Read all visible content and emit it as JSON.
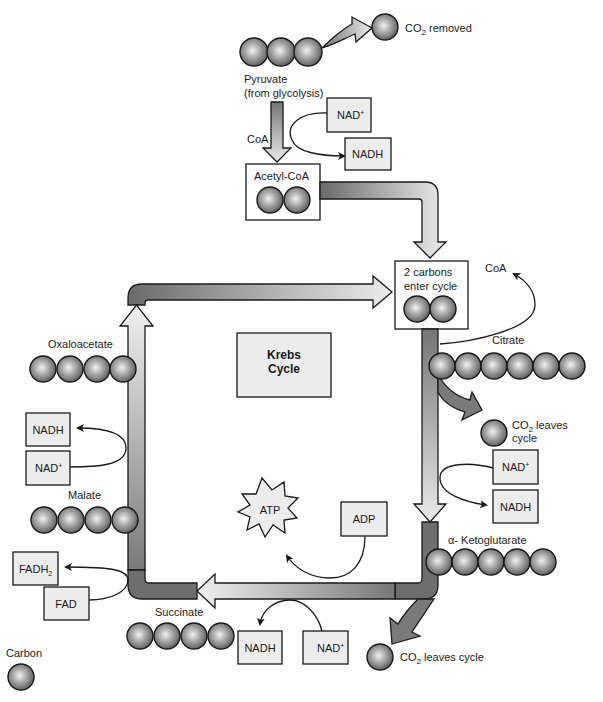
{
  "colors": {
    "outline": "#1a1a1a",
    "box_fill": "#ececec",
    "arrow_dark": "#6e6e6e",
    "arrow_light": "#e8e8e8",
    "ball_dark": "#5a5a5a",
    "ball_light": "#e6e6e6"
  },
  "top": {
    "pyruvate_label_1": "Pyruvate",
    "pyruvate_label_2": "(from glycolysis)",
    "pyruvate_carbons": 3,
    "co2_removed": "CO",
    "co2_removed_sub": "2",
    "co2_removed_suffix": " removed",
    "coa_label": "CoA",
    "nad_plus": "NAD",
    "nad_plus_sup": "+",
    "nadh": "NADH",
    "acetyl_coa": "Acetyl-CoA",
    "acetyl_carbons": 2
  },
  "entry": {
    "line1": "2 carbons",
    "line2": "enter cycle",
    "carbons": 2,
    "coa_label": "CoA"
  },
  "center": {
    "line1": "Krebs",
    "line2": "Cycle"
  },
  "right": {
    "citrate": "Citrate",
    "citrate_carbons": 6,
    "co2_leaves_1": "CO",
    "co2_leaves_sub": "2",
    "co2_leaves_suffix": " leaves",
    "co2_leaves_2": "cycle",
    "nad_plus": "NAD",
    "nad_plus_sup": "+",
    "nadh": "NADH",
    "ketoglutarate": "α- Ketoglutarate",
    "ketoglutarate_carbons": 5
  },
  "bottom": {
    "co2_leaves": "CO",
    "co2_leaves_sub": "2",
    "co2_leaves_suffix": " leaves cycle",
    "succinate": "Succinate",
    "succinate_carbons": 4,
    "nadh": "NADH",
    "nad_plus": "NAD",
    "nad_plus_sup": "+",
    "atp": "ATP",
    "adp": "ADP"
  },
  "left": {
    "oxaloacetate": "Oxaloacetate",
    "oxaloacetate_carbons": 4,
    "nadh": "NADH",
    "nad_plus": "NAD",
    "nad_plus_sup": "+",
    "malate": "Malate",
    "malate_carbons": 4,
    "fadh2": "FADH",
    "fadh2_sub": "2",
    "fad": "FAD"
  },
  "legend": {
    "carbon": "Carbon"
  }
}
